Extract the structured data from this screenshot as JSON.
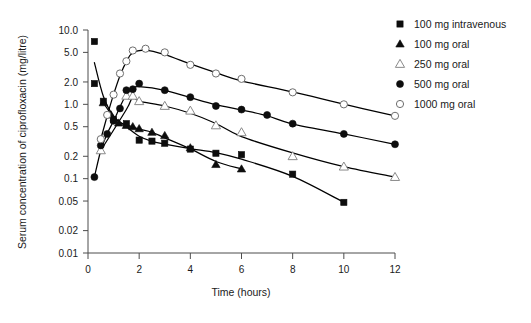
{
  "chart_data": {
    "type": "line",
    "title": "",
    "xlabel": "Time (hours)",
    "ylabel": "Serum concentration of ciprofloxacin (mg/litre)",
    "yscale": "log",
    "xlim": [
      0,
      12
    ],
    "ylim": [
      0.01,
      10.0
    ],
    "grid": false,
    "legend_position": "right",
    "xticks": [
      0,
      2,
      4,
      6,
      8,
      10,
      12
    ],
    "xtick_labels": [
      "0",
      "2",
      "4",
      "6",
      "8",
      "10",
      "12"
    ],
    "yticks": [
      10.0,
      5.0,
      2.0,
      1.0,
      0.5,
      0.2,
      0.1,
      0.05,
      0.02,
      0.01
    ],
    "ytick_labels": [
      "10.0",
      "5.0",
      "2.0",
      "1.0",
      "0.5",
      "0.2",
      "0.1",
      "0.05",
      "0.02",
      "0.01"
    ],
    "series": [
      {
        "name": "100 mg intravenous",
        "marker": "filled-square",
        "points": [
          {
            "x": 0.25,
            "y": 7.0
          },
          {
            "x": 0.25,
            "y": 1.9
          },
          {
            "x": 0.6,
            "y": 1.1
          },
          {
            "x": 1.0,
            "y": 0.62
          },
          {
            "x": 1.5,
            "y": 0.55
          },
          {
            "x": 2.0,
            "y": 0.33
          },
          {
            "x": 2.5,
            "y": 0.32
          },
          {
            "x": 3.0,
            "y": 0.3
          },
          {
            "x": 4.0,
            "y": 0.25
          },
          {
            "x": 5.0,
            "y": 0.22
          },
          {
            "x": 6.0,
            "y": 0.21
          },
          {
            "x": 8.0,
            "y": 0.115
          },
          {
            "x": 10.0,
            "y": 0.048
          }
        ]
      },
      {
        "name": "100 mg oral",
        "marker": "filled-triangle",
        "points": [
          {
            "x": 0.6,
            "y": 1.05
          },
          {
            "x": 0.9,
            "y": 0.72
          },
          {
            "x": 1.2,
            "y": 0.56
          },
          {
            "x": 1.5,
            "y": 0.52
          },
          {
            "x": 1.75,
            "y": 0.5
          },
          {
            "x": 2.0,
            "y": 0.47
          },
          {
            "x": 2.5,
            "y": 0.42
          },
          {
            "x": 3.0,
            "y": 0.38
          },
          {
            "x": 4.0,
            "y": 0.26
          },
          {
            "x": 5.0,
            "y": 0.155
          },
          {
            "x": 6.0,
            "y": 0.135
          }
        ]
      },
      {
        "name": "250 mg oral",
        "marker": "open-triangle",
        "points": [
          {
            "x": 0.5,
            "y": 0.24
          },
          {
            "x": 1.5,
            "y": 1.3
          },
          {
            "x": 1.75,
            "y": 1.3
          },
          {
            "x": 2.0,
            "y": 1.1
          },
          {
            "x": 3.0,
            "y": 0.95
          },
          {
            "x": 4.0,
            "y": 0.82
          },
          {
            "x": 5.0,
            "y": 0.52
          },
          {
            "x": 6.0,
            "y": 0.42
          },
          {
            "x": 8.0,
            "y": 0.2
          },
          {
            "x": 10.0,
            "y": 0.145
          },
          {
            "x": 12.0,
            "y": 0.105
          }
        ]
      },
      {
        "name": "500 mg oral",
        "marker": "filled-circle",
        "points": [
          {
            "x": 0.25,
            "y": 0.105
          },
          {
            "x": 0.5,
            "y": 0.28
          },
          {
            "x": 0.75,
            "y": 0.4
          },
          {
            "x": 1.0,
            "y": 0.6
          },
          {
            "x": 1.25,
            "y": 0.88
          },
          {
            "x": 1.5,
            "y": 1.55
          },
          {
            "x": 1.75,
            "y": 1.6
          },
          {
            "x": 2.0,
            "y": 1.9
          },
          {
            "x": 3.0,
            "y": 1.55
          },
          {
            "x": 4.0,
            "y": 1.25
          },
          {
            "x": 5.0,
            "y": 0.95
          },
          {
            "x": 6.0,
            "y": 0.85
          },
          {
            "x": 7.0,
            "y": 0.72
          },
          {
            "x": 8.0,
            "y": 0.55
          },
          {
            "x": 10.0,
            "y": 0.4
          },
          {
            "x": 12.0,
            "y": 0.29
          }
        ]
      },
      {
        "name": "1000 mg oral",
        "marker": "open-circle",
        "points": [
          {
            "x": 0.5,
            "y": 0.34
          },
          {
            "x": 0.75,
            "y": 0.72
          },
          {
            "x": 1.0,
            "y": 1.35
          },
          {
            "x": 1.25,
            "y": 2.6
          },
          {
            "x": 1.5,
            "y": 3.8
          },
          {
            "x": 1.75,
            "y": 5.3
          },
          {
            "x": 2.25,
            "y": 5.6
          },
          {
            "x": 3.0,
            "y": 5.0
          },
          {
            "x": 4.0,
            "y": 3.4
          },
          {
            "x": 5.0,
            "y": 2.6
          },
          {
            "x": 6.0,
            "y": 2.2
          },
          {
            "x": 8.0,
            "y": 1.45
          },
          {
            "x": 10.0,
            "y": 1.0
          },
          {
            "x": 12.0,
            "y": 0.7
          }
        ]
      }
    ]
  },
  "legend": {
    "items": [
      {
        "label": "100 mg intravenous",
        "marker": "filled-square"
      },
      {
        "label": "100 mg oral",
        "marker": "filled-triangle"
      },
      {
        "label": "250 mg oral",
        "marker": "open-triangle"
      },
      {
        "label": "500 mg oral",
        "marker": "filled-circle"
      },
      {
        "label": "1000 mg oral",
        "marker": "open-circle"
      }
    ]
  },
  "colors": {
    "filled": "#0d0d0d",
    "open_stroke": "#6e6e6e",
    "axis": "#4d4d4d",
    "curve": "#000000",
    "background": "#ffffff"
  }
}
